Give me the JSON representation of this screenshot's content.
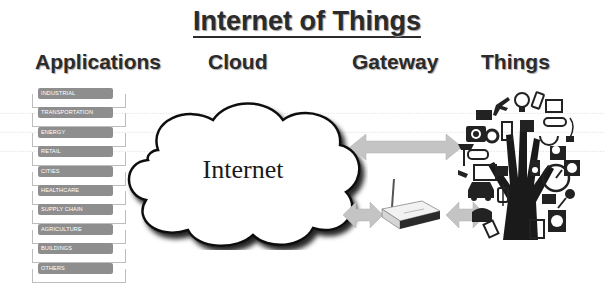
{
  "title": "Internet of Things",
  "columns": {
    "applications": "Applications",
    "cloud": "Cloud",
    "gateway": "Gateway",
    "things": "Things"
  },
  "applications": [
    {
      "label": "INDUSTRIAL"
    },
    {
      "label": "TRANSPORTATION"
    },
    {
      "label": "ENERGY"
    },
    {
      "label": "RETAIL"
    },
    {
      "label": "CITIES"
    },
    {
      "label": "HEALTHCARE"
    },
    {
      "label": "SUPPLY CHAIN"
    },
    {
      "label": "AGRICULTURE"
    },
    {
      "label": "BUILDINGS"
    },
    {
      "label": "OTHERS"
    }
  ],
  "cloud": {
    "label": "Internet",
    "icon": "cloud-icon"
  },
  "gateway": {
    "icon": "router-icon"
  },
  "things": {
    "icon": "hand-tree-of-devices-icon"
  },
  "connections": [
    {
      "from": "cloud",
      "to": "things",
      "type": "bidirectional-arrow"
    },
    {
      "from": "cloud",
      "to": "gateway",
      "type": "bidirectional-arrow"
    },
    {
      "from": "gateway",
      "to": "things",
      "type": "bidirectional-arrow"
    }
  ],
  "colors": {
    "label_fill": "#8e8e8e",
    "arrow": "#c4c4c4",
    "text": "#2b2b2b"
  }
}
